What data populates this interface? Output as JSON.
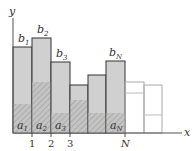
{
  "diagram": {
    "axis": {
      "x_label": "x",
      "y_label": "y"
    },
    "ticks": [
      "1",
      "2",
      "3",
      "N"
    ],
    "colors": {
      "bar_fill": "#cfcfcf",
      "hatch_fill": "#bdbdbd",
      "hatch_line": "#9a9a9a",
      "outline": "#333333",
      "empty_outline": "#aaaaaa"
    },
    "bars": [
      {
        "index": "1",
        "b_label": "b",
        "b_sub": "1",
        "a_label": "a",
        "a_sub": "1",
        "filled": true
      },
      {
        "index": "2",
        "b_label": "b",
        "b_sub": "2",
        "a_label": "a",
        "a_sub": "2",
        "filled": true
      },
      {
        "index": "3",
        "b_label": "b",
        "b_sub": "3",
        "a_label": "a",
        "a_sub": "3",
        "filled": true
      },
      {
        "index": "",
        "filled": true
      },
      {
        "index": "",
        "filled": true
      },
      {
        "index": "N",
        "b_label": "b",
        "b_sub": "N",
        "a_label": "a",
        "a_sub": "N",
        "filled": true
      },
      {
        "index": "",
        "filled": false
      },
      {
        "index": "",
        "filled": false
      }
    ]
  }
}
